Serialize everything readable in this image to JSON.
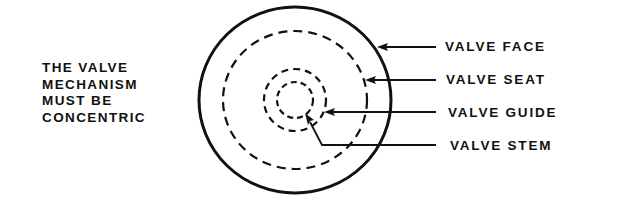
{
  "note": {
    "lines": [
      "THE VALVE",
      "MECHANISM",
      "MUST BE",
      "CONCENTRIC"
    ]
  },
  "labels": {
    "face": "VALVE FACE",
    "seat": "VALVE SEAT",
    "guide": "VALVE GUIDE",
    "stem": "VALVE STEM"
  },
  "colors": {
    "ink": "#111111",
    "background": "#ffffff"
  }
}
